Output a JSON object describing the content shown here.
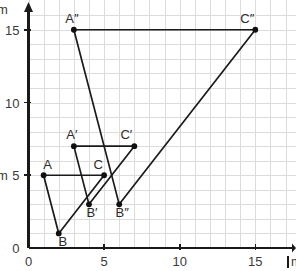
{
  "chart_data": {
    "type": "scatter",
    "title": "",
    "xlabel": "",
    "ylabel": "",
    "xlim": [
      0,
      17.5
    ],
    "ylim": [
      0,
      16.6
    ],
    "grid": true,
    "grid_step": 1,
    "legend": "none",
    "x_ticks": [
      0,
      5,
      10,
      15
    ],
    "y_ticks": [
      0,
      5,
      10,
      15
    ],
    "x_tick_labels": [
      "0",
      "5",
      "10",
      "15"
    ],
    "y_tick_labels": [
      "0",
      "5",
      "10",
      "15"
    ],
    "axis_unit_x": "m",
    "axis_unit_y": "m",
    "shapes": [
      {
        "name": "triangle-abc",
        "closed": true,
        "points": [
          {
            "label": "A",
            "x": 1,
            "y": 5,
            "label_dx": 4,
            "label_dy": -6
          },
          {
            "label": "B",
            "x": 2,
            "y": 1,
            "label_dx": 4,
            "label_dy": 13
          },
          {
            "label": "C",
            "x": 5,
            "y": 5,
            "label_dx": -6,
            "label_dy": -6
          }
        ]
      },
      {
        "name": "triangle-a-prime-b-prime-c-prime",
        "closed": true,
        "points": [
          {
            "label": "A′",
            "x": 3,
            "y": 7,
            "label_dx": -2,
            "label_dy": -7
          },
          {
            "label": "B′",
            "x": 4,
            "y": 3,
            "label_dx": 3,
            "label_dy": 13
          },
          {
            "label": "C′",
            "x": 7,
            "y": 7,
            "label_dx": -8,
            "label_dy": -7
          }
        ]
      },
      {
        "name": "triangle-a-double-prime-b-double-prime-c-double-prime",
        "closed": true,
        "points": [
          {
            "label": "A″",
            "x": 3,
            "y": 15,
            "label_dx": -2,
            "label_dy": -7
          },
          {
            "label": "B″",
            "x": 6,
            "y": 3,
            "label_dx": 3,
            "label_dy": 13
          },
          {
            "label": "C″",
            "x": 15,
            "y": 15,
            "label_dx": -8,
            "label_dy": -7
          }
        ]
      }
    ],
    "colors": {
      "grid": "#dcdcdc",
      "axis": "#1a1a1a",
      "edge": "#1a1a1a",
      "vertex": "#111111",
      "label": "#2b2b2b",
      "background": "#ffffff"
    }
  }
}
